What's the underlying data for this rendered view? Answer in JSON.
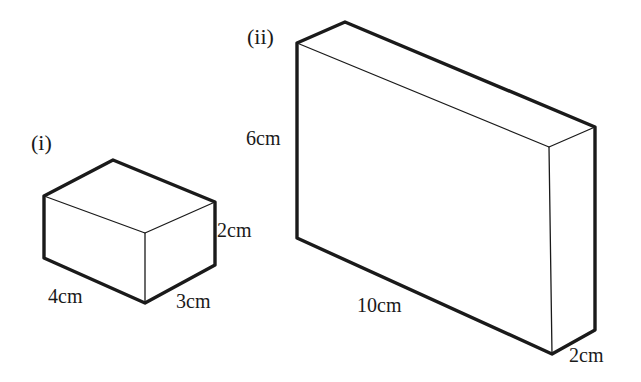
{
  "page": {
    "background_color": "#ffffff",
    "stroke_color": "#1a1a1a",
    "width": 641,
    "height": 382
  },
  "figures": [
    {
      "id": "figure-i",
      "label": "(i)",
      "label_pos": {
        "x": 31,
        "y": 132
      },
      "shape": "cuboid",
      "dimensions": [
        {
          "name": "length",
          "value": "4",
          "unit": "cm",
          "text": "4cm",
          "pos": {
            "x": 48,
            "y": 286
          }
        },
        {
          "name": "width",
          "value": "3",
          "unit": "cm",
          "text": "3cm",
          "pos": {
            "x": 176,
            "y": 291
          }
        },
        {
          "name": "height",
          "value": "2",
          "unit": "cm",
          "text": "2cm",
          "pos": {
            "x": 217,
            "y": 220
          }
        }
      ],
      "vertices": {
        "front_bottom_left": {
          "x": 44,
          "y": 258
        },
        "front_bottom_mid": {
          "x": 145,
          "y": 303
        },
        "front_bottom_right": {
          "x": 215,
          "y": 265
        },
        "front_top_left": {
          "x": 44,
          "y": 196
        },
        "front_top_mid": {
          "x": 145,
          "y": 233
        },
        "front_top_right": {
          "x": 215,
          "y": 202
        },
        "back_top": {
          "x": 113,
          "y": 160
        },
        "back_top_right": {
          "x": 215,
          "y": 202
        }
      }
    },
    {
      "id": "figure-ii",
      "label": "(ii)",
      "label_pos": {
        "x": 247,
        "y": 26
      },
      "shape": "cuboid",
      "dimensions": [
        {
          "name": "length",
          "value": "10",
          "unit": "cm",
          "text": "10cm",
          "pos": {
            "x": 357,
            "y": 295
          }
        },
        {
          "name": "depth",
          "value": "2",
          "unit": "cm",
          "text": "2cm",
          "pos": {
            "x": 569,
            "y": 345
          }
        },
        {
          "name": "height",
          "value": "6",
          "unit": "cm",
          "text": "6cm",
          "pos": {
            "x": 246,
            "y": 128
          }
        }
      ],
      "vertices": {
        "front_top_left": {
          "x": 297,
          "y": 43
        },
        "front_bottom_left": {
          "x": 297,
          "y": 238
        },
        "front_bottom_right": {
          "x": 552,
          "y": 354
        },
        "front_top_right": {
          "x": 549,
          "y": 147
        },
        "back_top_left": {
          "x": 345,
          "y": 22
        },
        "back_top_right": {
          "x": 595,
          "y": 127
        },
        "back_bottom_right": {
          "x": 595,
          "y": 330
        }
      }
    }
  ]
}
